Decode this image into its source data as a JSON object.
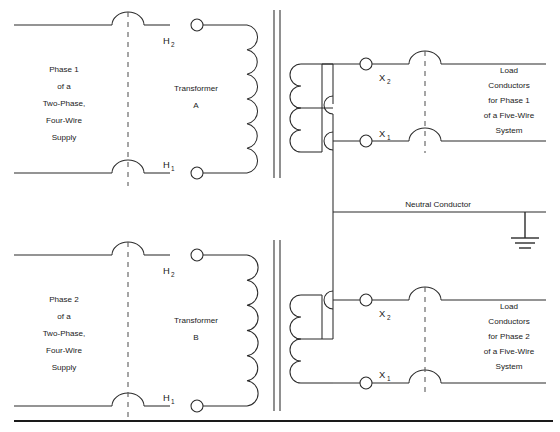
{
  "diagram": {
    "line_color": "#2b2b2b",
    "dash_color": "#555555",
    "background": "#ffffff"
  },
  "phase1": {
    "supply_label_lines": [
      "Phase 1",
      "of a",
      "Two-Phase,",
      "Four-Wire",
      "Supply"
    ],
    "transformer_label_lines": [
      "Transformer",
      "A"
    ],
    "primary_top_terminal": "H",
    "primary_top_subscript": "2",
    "primary_bottom_terminal": "H",
    "primary_bottom_subscript": "1",
    "secondary_top_terminal": "X",
    "secondary_top_subscript": "2",
    "secondary_bottom_terminal": "X",
    "secondary_bottom_subscript": "1",
    "load_label_lines": [
      "Load",
      "Conductors",
      "for Phase 1",
      "of a Five-Wire",
      "System"
    ]
  },
  "phase2": {
    "supply_label_lines": [
      "Phase 2",
      "of a",
      "Two-Phase,",
      "Four-Wire",
      "Supply"
    ],
    "transformer_label_lines": [
      "Transformer",
      "B"
    ],
    "primary_top_terminal": "H",
    "primary_top_subscript": "2",
    "primary_bottom_terminal": "H",
    "primary_bottom_subscript": "1",
    "secondary_top_terminal": "X",
    "secondary_top_subscript": "2",
    "secondary_bottom_terminal": "X",
    "secondary_bottom_subscript": "1",
    "load_label_lines": [
      "Load",
      "Conductors",
      "for Phase 2",
      "of a Five-Wire",
      "System"
    ]
  },
  "neutral": {
    "label": "Neutral Conductor",
    "ground_symbol": "earth-ground"
  }
}
